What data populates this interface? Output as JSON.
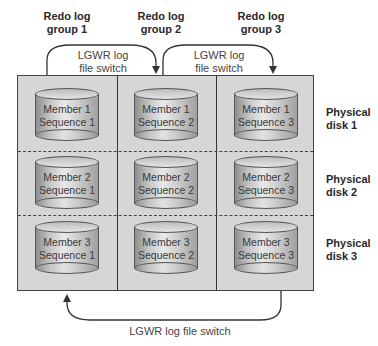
{
  "groups": [
    {
      "label": "Redo log group 1",
      "line1": "Redo log",
      "line2": "group 1"
    },
    {
      "label": "Redo log group 2",
      "line1": "Redo log",
      "line2": "group 2"
    },
    {
      "label": "Redo log group 3",
      "line1": "Redo log",
      "line2": "group 3"
    }
  ],
  "disks": [
    {
      "line1": "Physical",
      "line2": "disk 1"
    },
    {
      "line1": "Physical",
      "line2": "disk 2"
    },
    {
      "line1": "Physical",
      "line2": "disk 3"
    }
  ],
  "members": [
    [
      {
        "member": "Member 1",
        "sequence": "Sequence 1"
      },
      {
        "member": "Member 1",
        "sequence": "Sequence 2"
      },
      {
        "member": "Member 1",
        "sequence": "Sequence 3"
      }
    ],
    [
      {
        "member": "Member 2",
        "sequence": "Sequence 1"
      },
      {
        "member": "Member 2",
        "sequence": "Sequence 2"
      },
      {
        "member": "Member 2",
        "sequence": "Sequence 3"
      }
    ],
    [
      {
        "member": "Member 3",
        "sequence": "Sequence 1"
      },
      {
        "member": "Member 3",
        "sequence": "Sequence 2"
      },
      {
        "member": "Member 3",
        "sequence": "Sequence 3"
      }
    ]
  ],
  "switches": {
    "top_1": {
      "line1": "LGWR log",
      "line2": "file switch"
    },
    "top_2": {
      "line1": "LGWR log",
      "line2": "file switch"
    },
    "bottom": "LGWR log file switch"
  },
  "colors": {
    "grid_fill": "#d6d6d6",
    "border": "#444444",
    "cylinder": "#c4c4c4"
  }
}
